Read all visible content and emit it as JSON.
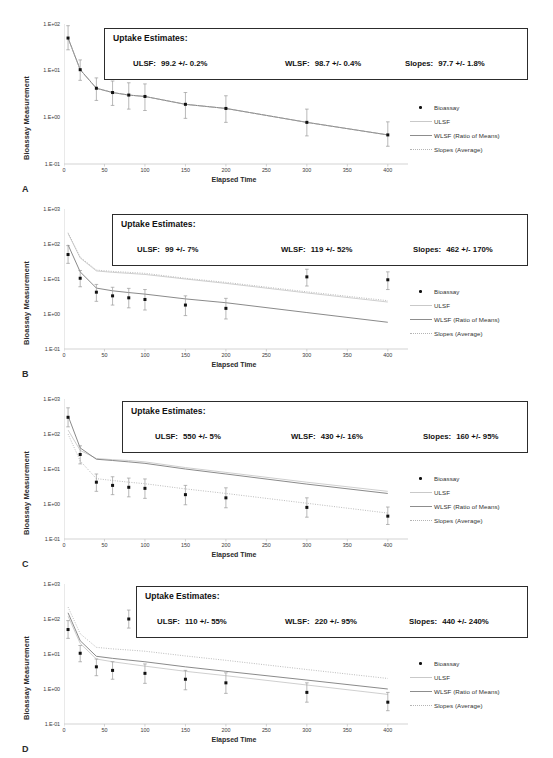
{
  "figure": {
    "panel_count": 4,
    "common": {
      "ylabel": "Bioassay Measurement",
      "xlabel": "Elapsed Time",
      "xticks": [
        "0",
        "50",
        "100",
        "150",
        "200",
        "250",
        "300",
        "350",
        "400"
      ],
      "estimates_title": "Uptake Estimates:",
      "legend": [
        {
          "key": "marker-dot",
          "label": "Bioassay"
        },
        {
          "key": "line-light",
          "label": "ULSF"
        },
        {
          "key": "line-solid",
          "label": "WLSF (Ratio of Means)"
        },
        {
          "key": "line-dotted",
          "label": "Slopes (Average)"
        }
      ],
      "colors": {
        "marker": "#111111",
        "errorbar": "#9a9a9a",
        "ulsf": "#c9c9c9",
        "wlsf": "#7d7d7d",
        "slopes": "#b4b4b4",
        "axis": "#c8c8c8",
        "box_border": "#2c2c2c",
        "text": "#1a1a1a"
      }
    },
    "panels": [
      {
        "letter": "A",
        "yticks": [
          "1.E+02",
          "1.E+01",
          "1.E+00",
          "1.E-01"
        ],
        "ylim": [
          0.1,
          100
        ],
        "estimates": [
          {
            "name": "ULSF:",
            "value": "99.2 +/- 0.2%"
          },
          {
            "name": "WLSF:",
            "value": "98.7 +/- 0.4%"
          },
          {
            "name": "Slopes:",
            "value": "97.7 +/- 1.8%"
          }
        ]
      },
      {
        "letter": "B",
        "yticks": [
          "1.E+03",
          "1.E+02",
          "1.E+01",
          "1.E+00",
          "1.E-01"
        ],
        "ylim": [
          0.1,
          1000
        ],
        "estimates": [
          {
            "name": "ULSF:",
            "value": "99 +/- 7%"
          },
          {
            "name": "WLSF:",
            "value": "119 +/- 52%"
          },
          {
            "name": "Slopes:",
            "value": "462 +/- 170%"
          }
        ]
      },
      {
        "letter": "C",
        "yticks": [
          "1.E+03",
          "1.E+02",
          "1.E+01",
          "1.E+00",
          "1.E-01"
        ],
        "ylim": [
          0.1,
          1000
        ],
        "estimates": [
          {
            "name": "ULSF:",
            "value": "550 +/- 5%"
          },
          {
            "name": "WLSF:",
            "value": "430 +/- 16%"
          },
          {
            "name": "Slopes:",
            "value": "160 +/- 95%"
          }
        ]
      },
      {
        "letter": "D",
        "yticks": [
          "1.E+03",
          "1.E+02",
          "1.E+01",
          "1.E+00",
          "1.E-01"
        ],
        "ylim": [
          0.1,
          1000
        ],
        "estimates": [
          {
            "name": "ULSF:",
            "value": "110 +/- 55%"
          },
          {
            "name": "WLSF:",
            "value": "220 +/- 95%"
          },
          {
            "name": "Slopes:",
            "value": "440 +/- 240%"
          }
        ]
      }
    ]
  },
  "chart_data": [
    {
      "type": "scatter",
      "panel": "A",
      "title": "",
      "xlabel": "Elapsed Time",
      "ylabel": "Bioassay Measurement",
      "yscale": "log",
      "ylim": [
        0.1,
        100
      ],
      "xlim": [
        0,
        420
      ],
      "grid": false,
      "legend_position": "right",
      "x": [
        5,
        20,
        40,
        60,
        80,
        100,
        150,
        200,
        300,
        400
      ],
      "series": [
        {
          "name": "Bioassay",
          "type": "scatter-errorbar",
          "values": [
            50,
            10.5,
            4.2,
            3.4,
            3.0,
            2.8,
            1.9,
            1.55,
            0.78,
            0.42
          ],
          "err_low": [
            28,
            6.2,
            2.3,
            1.8,
            1.5,
            1.4,
            0.95,
            0.78,
            0.4,
            0.24
          ],
          "err_high": [
            92,
            17.0,
            7.0,
            6.0,
            5.5,
            5.2,
            3.4,
            2.9,
            1.5,
            0.8
          ]
        },
        {
          "name": "ULSF",
          "type": "line",
          "values": [
            50,
            10.5,
            4.2,
            3.4,
            3.0,
            2.8,
            1.9,
            1.55,
            0.78,
            0.42
          ]
        },
        {
          "name": "WLSF (Ratio of Means)",
          "type": "line",
          "values": [
            50,
            10.5,
            4.2,
            3.4,
            3.0,
            2.8,
            1.9,
            1.55,
            0.78,
            0.42
          ]
        },
        {
          "name": "Slopes (Average)",
          "type": "line",
          "values": [
            50,
            10.5,
            4.2,
            3.4,
            3.0,
            2.8,
            1.9,
            1.55,
            0.78,
            0.42
          ]
        }
      ]
    },
    {
      "type": "scatter",
      "panel": "B",
      "title": "",
      "xlabel": "Elapsed Time",
      "ylabel": "Bioassay Measurement",
      "yscale": "log",
      "ylim": [
        0.1,
        1000
      ],
      "xlim": [
        0,
        420
      ],
      "grid": false,
      "legend_position": "right",
      "x": [
        5,
        20,
        40,
        60,
        80,
        100,
        150,
        200,
        300,
        400
      ],
      "series": [
        {
          "name": "Bioassay",
          "type": "scatter-errorbar",
          "values": [
            50,
            10.5,
            4.2,
            3.3,
            2.9,
            2.6,
            1.8,
            1.45,
            11.5,
            9.5
          ],
          "err_low": [
            28,
            6.0,
            2.3,
            1.8,
            1.5,
            1.3,
            0.9,
            0.72,
            6.3,
            5.0
          ],
          "err_high": [
            90,
            17.5,
            7.0,
            5.8,
            5.4,
            5.0,
            3.3,
            2.8,
            19.0,
            16.0
          ]
        },
        {
          "name": "ULSF",
          "type": "line",
          "values": [
            200,
            40,
            17,
            15.5,
            14.5,
            13.5,
            10.0,
            7.5,
            4.0,
            2.2
          ]
        },
        {
          "name": "WLSF (Ratio of Means)",
          "type": "line",
          "values": [
            95,
            16,
            5.5,
            4.6,
            4.1,
            3.7,
            2.7,
            2.1,
            1.1,
            0.58
          ]
        },
        {
          "name": "Slopes (Average)",
          "type": "line",
          "values": [
            210,
            42,
            18,
            16.5,
            15.5,
            14.5,
            10.5,
            8.0,
            4.3,
            2.4
          ]
        }
      ]
    },
    {
      "type": "scatter",
      "panel": "C",
      "title": "",
      "xlabel": "Elapsed Time",
      "ylabel": "Bioassay Measurement",
      "yscale": "log",
      "ylim": [
        0.1,
        1000
      ],
      "xlim": [
        0,
        420
      ],
      "grid": false,
      "legend_position": "right",
      "x": [
        5,
        20,
        40,
        60,
        80,
        100,
        150,
        200,
        300,
        400
      ],
      "series": [
        {
          "name": "Bioassay",
          "type": "scatter-errorbar",
          "values": [
            300,
            26,
            4.2,
            3.4,
            3.0,
            2.8,
            1.85,
            1.5,
            0.8,
            0.45
          ],
          "err_low": [
            160,
            14,
            2.3,
            1.85,
            1.6,
            1.45,
            0.95,
            0.78,
            0.42,
            0.26
          ],
          "err_high": [
            560,
            46,
            7.2,
            6.0,
            5.5,
            5.2,
            3.4,
            2.9,
            1.5,
            0.82
          ]
        },
        {
          "name": "ULSF",
          "type": "line",
          "values": [
            130,
            34,
            20,
            18.5,
            17.5,
            16.0,
            11.0,
            8.0,
            4.2,
            2.3
          ]
        },
        {
          "name": "WLSF (Ratio of Means)",
          "type": "line",
          "values": [
            330,
            40,
            19,
            17.5,
            16.0,
            14.5,
            10.0,
            7.2,
            3.7,
            2.0
          ]
        },
        {
          "name": "Slopes (Average)",
          "type": "line",
          "values": [
            100,
            17,
            5.3,
            4.7,
            4.2,
            3.8,
            2.7,
            2.0,
            1.05,
            0.55
          ]
        }
      ]
    },
    {
      "type": "scatter",
      "panel": "D",
      "title": "",
      "xlabel": "Elapsed Time",
      "ylabel": "Bioassay Measurement",
      "yscale": "log",
      "ylim": [
        0.1,
        1000
      ],
      "xlim": [
        0,
        420
      ],
      "grid": false,
      "legend_position": "right",
      "x": [
        5,
        20,
        40,
        60,
        80,
        100,
        150,
        200,
        300,
        400
      ],
      "series": [
        {
          "name": "Bioassay",
          "type": "scatter-errorbar",
          "values": [
            50,
            10.5,
            4.3,
            3.4,
            100,
            2.8,
            1.9,
            1.5,
            0.8,
            0.42
          ],
          "err_low": [
            28,
            6.0,
            2.4,
            1.9,
            55,
            1.45,
            0.95,
            0.75,
            0.42,
            0.24
          ],
          "err_high": [
            90,
            17.5,
            7.2,
            6.0,
            180,
            5.2,
            3.4,
            2.9,
            1.5,
            0.8
          ]
        },
        {
          "name": "ULSF",
          "type": "line",
          "values": [
            120,
            20,
            7.2,
            6.0,
            5.2,
            4.5,
            3.2,
            2.4,
            1.3,
            0.7
          ]
        },
        {
          "name": "WLSF (Ratio of Means)",
          "type": "line",
          "values": [
            150,
            24,
            8.6,
            7.5,
            6.7,
            6.0,
            4.3,
            3.2,
            1.8,
            1.0
          ]
        },
        {
          "name": "Slopes (Average)",
          "type": "line",
          "values": [
            220,
            38,
            15.5,
            14.0,
            13.0,
            12.0,
            8.8,
            6.6,
            3.6,
            2.0
          ]
        }
      ]
    }
  ]
}
